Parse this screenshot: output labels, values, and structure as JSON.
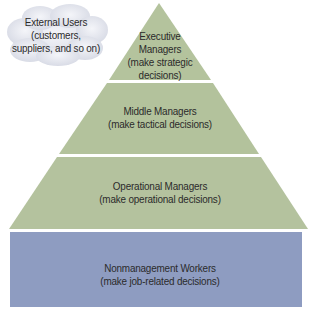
{
  "diagram": {
    "type": "pyramid",
    "colors": {
      "tier_green": "#b4c39d",
      "base_blue": "#8d9cc0",
      "cloud": "#e4e6ee",
      "background": "#ffffff"
    },
    "cloud": {
      "line1": "External Users",
      "line2": "(customers,",
      "line3": "suppliers, and so on)"
    },
    "tiers": [
      {
        "line1": "Executive",
        "line2": "Managers",
        "line3": "(make strategic",
        "line4": "decisions)"
      },
      {
        "line1": "Middle Managers",
        "line2": "(make tactical decisions)"
      },
      {
        "line1": "Operational Managers",
        "line2": "(make operational decisions)"
      },
      {
        "line1": "Nonmanagement Workers",
        "line2": "(make job-related decisions)"
      }
    ]
  }
}
